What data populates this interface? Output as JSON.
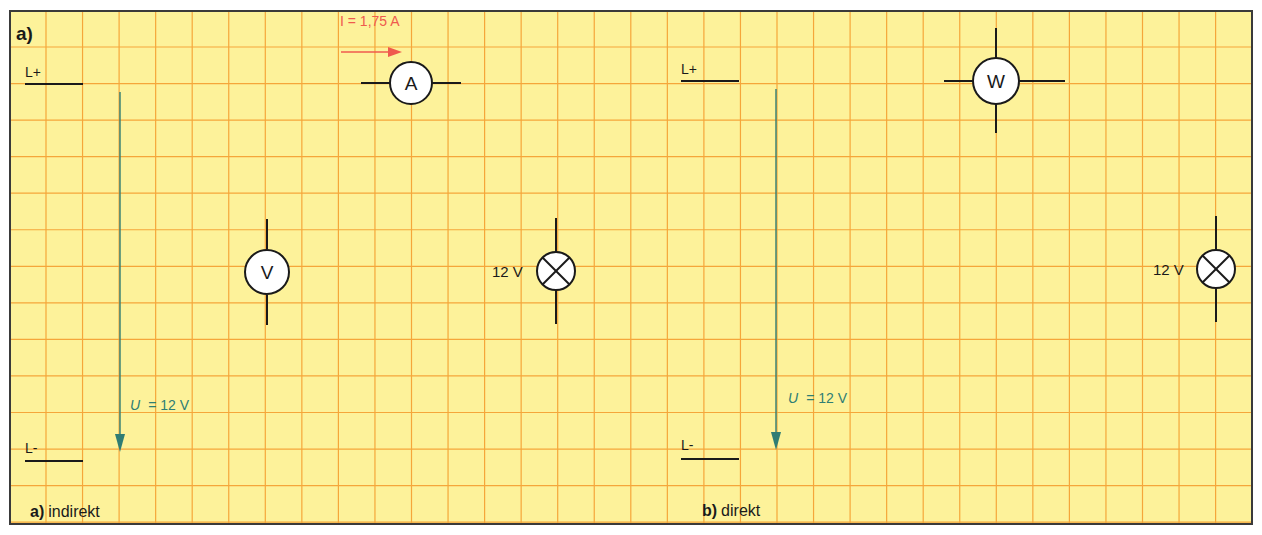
{
  "colors": {
    "paper": "#fdf29a",
    "grid": "#f5a63a",
    "border": "#3a3a3a",
    "wire": "#1a1a1a",
    "voltage_arrow": "#2f7d74",
    "current_arrow": "#ef5a4e"
  },
  "corner_label": "a)",
  "panel_a": {
    "caption_letter": "a)",
    "caption_text": "indirekt",
    "rail_plus": "L+",
    "rail_minus": "L-",
    "voltage_label_symbol": "U",
    "voltage_label_value": "= 12 V",
    "current_label": "I = 1,75 A",
    "ammeter_symbol": "A",
    "voltmeter_symbol": "V",
    "lamp_rating": "12 V"
  },
  "panel_b": {
    "caption_letter": "b)",
    "caption_text": "direkt",
    "rail_plus": "L+",
    "rail_minus": "L-",
    "voltage_label_symbol": "U",
    "voltage_label_value": "= 12 V",
    "wattmeter_symbol": "W",
    "lamp_rating": "12 V"
  }
}
